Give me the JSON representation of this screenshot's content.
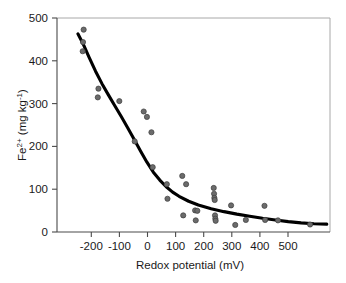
{
  "chart_data": {
    "type": "scatter",
    "title": "",
    "xlabel": "Redox potential (mV)",
    "ylabel_parts": {
      "base": "Fe",
      "superscript": "2+",
      "units_open": " (mg kg",
      "units_exp": "-1",
      "units_close": ")"
    },
    "ylabel": "Fe2+ (mg kg-1)",
    "xlim": [
      -280,
      570
    ],
    "ylim": [
      -15,
      500
    ],
    "xticks": [
      -200,
      -100,
      0,
      100,
      200,
      300,
      400,
      500
    ],
    "yticks": [
      0,
      100,
      200,
      300,
      400,
      500
    ],
    "xtick_labels": [
      "-200",
      "-100",
      "0",
      "100",
      "200",
      "300",
      "400",
      "500"
    ],
    "ytick_labels": [
      "0",
      "100",
      "200",
      "300",
      "400",
      "500"
    ],
    "grid": false,
    "legend": false,
    "marker": {
      "shape": "circle",
      "fill_color": "#6b6b6b",
      "edge_color": "#3d3d3d",
      "size_px": 5.2
    },
    "points": [
      {
        "x": -197,
        "y": 472
      },
      {
        "x": -199,
        "y": 442
      },
      {
        "x": -200,
        "y": 420
      },
      {
        "x": -151,
        "y": 330
      },
      {
        "x": -153,
        "y": 309
      },
      {
        "x": -86,
        "y": 300
      },
      {
        "x": -38,
        "y": 203
      },
      {
        "x": -10,
        "y": 275
      },
      {
        "x": 0,
        "y": 262
      },
      {
        "x": 14,
        "y": 225
      },
      {
        "x": 18,
        "y": 141
      },
      {
        "x": 62,
        "y": 100
      },
      {
        "x": 64,
        "y": 65
      },
      {
        "x": 110,
        "y": 120
      },
      {
        "x": 113,
        "y": 25
      },
      {
        "x": 122,
        "y": 100
      },
      {
        "x": 150,
        "y": 37
      },
      {
        "x": 152,
        "y": 13
      },
      {
        "x": 157,
        "y": 36
      },
      {
        "x": 208,
        "y": 91
      },
      {
        "x": 209,
        "y": 77
      },
      {
        "x": 210,
        "y": 67
      },
      {
        "x": 211,
        "y": 62
      },
      {
        "x": 212,
        "y": 25
      },
      {
        "x": 213,
        "y": 17
      },
      {
        "x": 214,
        "y": 12
      },
      {
        "x": 262,
        "y": 49
      },
      {
        "x": 275,
        "y": 2
      },
      {
        "x": 308,
        "y": 14
      },
      {
        "x": 366,
        "y": 48
      },
      {
        "x": 368,
        "y": 14
      },
      {
        "x": 408,
        "y": 13
      },
      {
        "x": 508,
        "y": 3
      }
    ],
    "fit_curve": {
      "description": "decreasing sigmoid/exponential fit line",
      "color": "#000000",
      "points": [
        {
          "x": -215,
          "y": 462
        },
        {
          "x": -200,
          "y": 440
        },
        {
          "x": -180,
          "y": 405
        },
        {
          "x": -160,
          "y": 372
        },
        {
          "x": -140,
          "y": 342
        },
        {
          "x": -120,
          "y": 315
        },
        {
          "x": -100,
          "y": 289
        },
        {
          "x": -80,
          "y": 263
        },
        {
          "x": -60,
          "y": 236
        },
        {
          "x": -40,
          "y": 208
        },
        {
          "x": -20,
          "y": 180
        },
        {
          "x": 0,
          "y": 153
        },
        {
          "x": 20,
          "y": 129
        },
        {
          "x": 40,
          "y": 110
        },
        {
          "x": 60,
          "y": 94
        },
        {
          "x": 80,
          "y": 81
        },
        {
          "x": 100,
          "y": 71
        },
        {
          "x": 130,
          "y": 59
        },
        {
          "x": 160,
          "y": 50
        },
        {
          "x": 200,
          "y": 41
        },
        {
          "x": 240,
          "y": 34
        },
        {
          "x": 280,
          "y": 28
        },
        {
          "x": 320,
          "y": 23
        },
        {
          "x": 360,
          "y": 18
        },
        {
          "x": 400,
          "y": 14
        },
        {
          "x": 440,
          "y": 10
        },
        {
          "x": 480,
          "y": 7
        },
        {
          "x": 520,
          "y": 5
        },
        {
          "x": 560,
          "y": 4
        }
      ]
    }
  }
}
